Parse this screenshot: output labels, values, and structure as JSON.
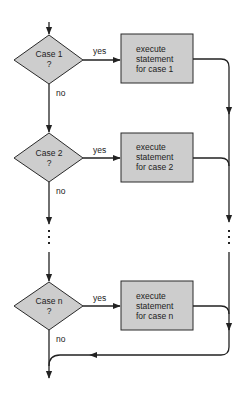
{
  "diagram": {
    "type": "flowchart",
    "title": "",
    "colors": {
      "fill": "#cdcdcd",
      "stroke": "#222222",
      "background": "#ffffff"
    },
    "decisions": [
      {
        "line1": "Case 1",
        "line2": "?",
        "yes_label": "yes",
        "no_label": "no"
      },
      {
        "line1": "Case 2",
        "line2": "?",
        "yes_label": "yes",
        "no_label": "no"
      },
      {
        "line1": "Case n",
        "line2": "?",
        "yes_label": "yes",
        "no_label": "no"
      }
    ],
    "processes": [
      {
        "line1": "execute",
        "line2": "statement",
        "line3": "for case 1"
      },
      {
        "line1": "execute",
        "line2": "statement",
        "line3": "for case 2"
      },
      {
        "line1": "execute",
        "line2": "statement",
        "line3": "for case n"
      }
    ],
    "ellipsis": "⋮"
  }
}
